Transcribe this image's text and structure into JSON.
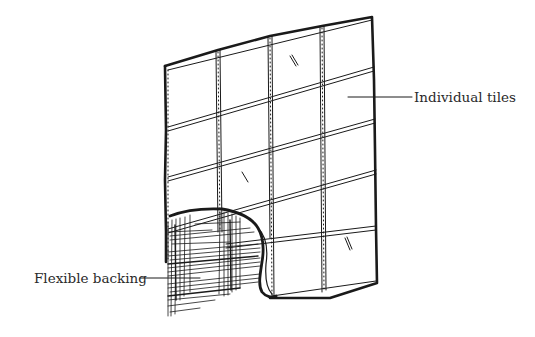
{
  "diagram": {
    "type": "illustration",
    "grid": {
      "columns": 4,
      "rows": 5
    },
    "labels": {
      "tiles": "Individual tiles",
      "backing": "Flexible backing"
    },
    "colors": {
      "ink": "#1a1a1a",
      "background": "#ffffff",
      "text": "#2a2a2a"
    }
  }
}
